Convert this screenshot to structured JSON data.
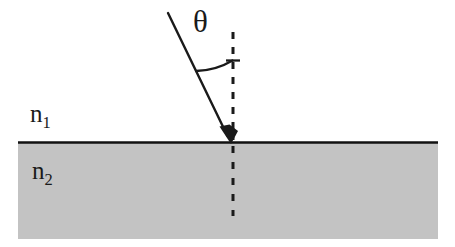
{
  "figure": {
    "type": "optics-ray-diagram",
    "canvas": {
      "width": 455,
      "height": 247,
      "background": "#ffffff"
    },
    "labels": {
      "medium_upper_symbol": "n",
      "medium_upper_subscript": "1",
      "medium_lower_symbol": "n",
      "medium_lower_subscript": "2",
      "angle_symbol": "θ"
    },
    "colors": {
      "ink": "#1a1a1a",
      "interface_line": "#111111",
      "medium_lower_fill": "#c3c3c3",
      "background": "#ffffff"
    },
    "geometry": {
      "interface_y": 142,
      "medium_lower_left": 18,
      "medium_lower_right": 438,
      "medium_lower_bottom": 239,
      "incident_ray_start": [
        168,
        13
      ],
      "incident_ray_end": [
        231,
        143
      ],
      "normal_x": 233,
      "normal_top_y": 32,
      "normal_bottom_y": 216,
      "arc_start": [
        195,
        70
      ],
      "arc_end": [
        233,
        60
      ],
      "angle_tick_y": 60
    }
  }
}
